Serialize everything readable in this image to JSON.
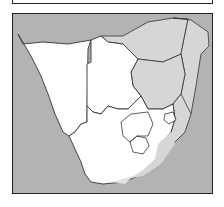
{
  "map": {
    "region": "Southern Africa",
    "colors": {
      "ocean": "#b3b3b3",
      "land": "#ffffff",
      "highlight": "#d6d6d6",
      "border": "#333333",
      "frame": "#222222"
    },
    "countries": [
      {
        "name": "Namibia",
        "fill": "land"
      },
      {
        "name": "Botswana",
        "fill": "land"
      },
      {
        "name": "South Africa",
        "fill": "land"
      },
      {
        "name": "Lesotho",
        "fill": "land"
      },
      {
        "name": "Swaziland",
        "fill": "land"
      },
      {
        "name": "Zimbabwe",
        "fill": "highlight"
      },
      {
        "name": "Mozambique",
        "fill": "highlight"
      },
      {
        "name": "Zambia",
        "fill": "highlight"
      },
      {
        "name": "Malawi",
        "fill": "highlight"
      }
    ]
  }
}
